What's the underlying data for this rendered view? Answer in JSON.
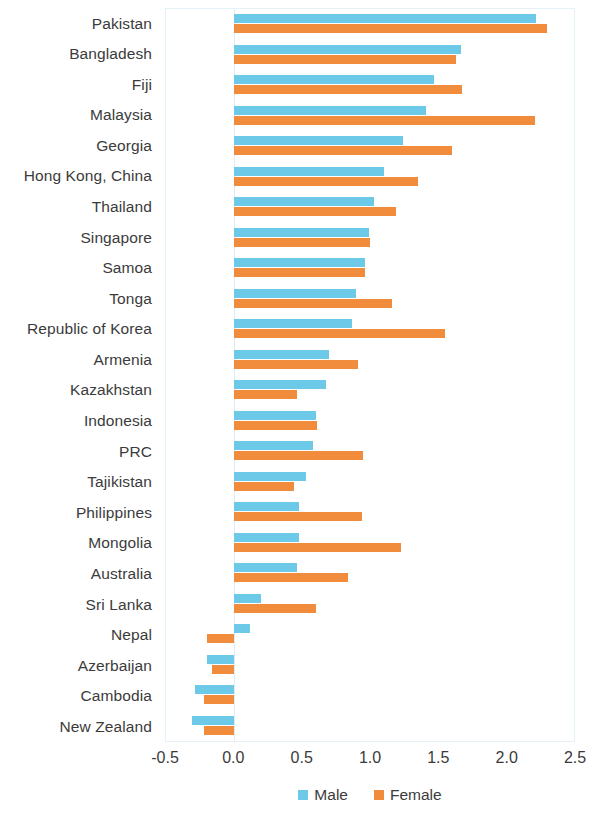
{
  "chart_data": {
    "type": "bar",
    "orientation": "horizontal",
    "title": "",
    "subtitle": "",
    "xlabel": "",
    "ylabel": "",
    "xlim": [
      -0.5,
      2.5
    ],
    "xticks": [
      "-0.5",
      "0.0",
      "0.5",
      "1.0",
      "1.5",
      "2.0",
      "2.5"
    ],
    "xtick_values": [
      -0.5,
      0.0,
      0.5,
      1.0,
      1.5,
      2.0,
      2.5
    ],
    "grid": false,
    "legend_position": "bottom",
    "categories": [
      "Pakistan",
      "Bangladesh",
      "Fiji",
      "Malaysia",
      "Georgia",
      "Hong Kong, China",
      "Thailand",
      "Singapore",
      "Samoa",
      "Tonga",
      "Republic of Korea",
      "Armenia",
      "Kazakhstan",
      "Indonesia",
      "PRC",
      "Tajikistan",
      "Philippines",
      "Mongolia",
      "Australia",
      "Sri Lanka",
      "Nepal",
      "Azerbaijan",
      "Cambodia",
      "New Zealand"
    ],
    "series": [
      {
        "name": "Male",
        "color": "#6CC9E8",
        "values": [
          2.22,
          1.67,
          1.47,
          1.41,
          1.24,
          1.1,
          1.03,
          0.99,
          0.96,
          0.9,
          0.87,
          0.7,
          0.68,
          0.6,
          0.58,
          0.53,
          0.48,
          0.48,
          0.46,
          0.2,
          0.12,
          -0.2,
          -0.29,
          -0.31
        ]
      },
      {
        "name": "Female",
        "color": "#F08C3C",
        "values": [
          2.3,
          1.63,
          1.68,
          2.21,
          1.6,
          1.35,
          1.19,
          1.0,
          0.96,
          1.16,
          1.55,
          0.91,
          0.46,
          0.61,
          0.95,
          0.44,
          0.94,
          1.23,
          0.84,
          0.6,
          -0.2,
          -0.16,
          -0.22,
          -0.22
        ]
      }
    ]
  },
  "legend": {
    "items": [
      {
        "label": "Male",
        "color": "#6CC9E8"
      },
      {
        "label": "Female",
        "color": "#F08C3C"
      }
    ]
  }
}
